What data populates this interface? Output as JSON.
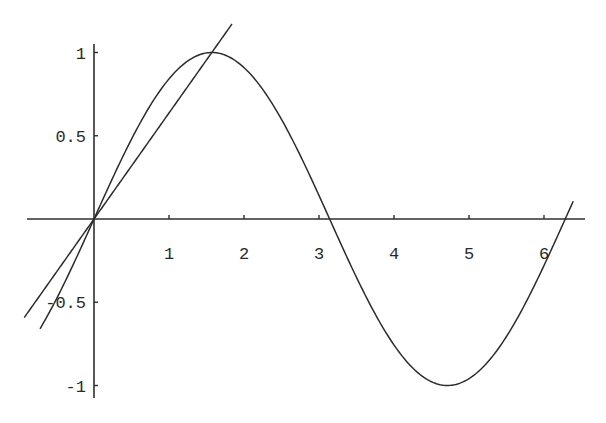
{
  "chart_data": {
    "type": "line",
    "title": "",
    "xlabel": "",
    "ylabel": "",
    "xlim": [
      -0.9,
      6.6
    ],
    "ylim": [
      -1.07,
      1.05
    ],
    "grid": false,
    "legend": null,
    "x_ticks": [
      1,
      2,
      3,
      4,
      5,
      6
    ],
    "x_tick_labels": [
      "1",
      "2",
      "3",
      "4",
      "5",
      "6"
    ],
    "y_ticks": [
      1,
      0.5,
      -0.5,
      -1
    ],
    "y_tick_labels": [
      "1",
      "0.5",
      "-0.5",
      "-1"
    ],
    "series": [
      {
        "name": "sin(x)",
        "function": "sin(x)",
        "x_range": [
          -0.72,
          6.39
        ],
        "x": [
          -0.72,
          0,
          0.5,
          1,
          1.5708,
          2,
          2.5,
          3,
          3.1416,
          3.5,
          4,
          4.7124,
          5,
          5.5,
          6,
          6.2832,
          6.39
        ],
        "values": [
          -0.66,
          0,
          0.479,
          0.841,
          1,
          0.909,
          0.598,
          0.141,
          0,
          -0.351,
          -0.757,
          -1,
          -0.959,
          -0.706,
          -0.279,
          0,
          0.106
        ]
      },
      {
        "name": "line y = (2/pi) x",
        "function": "2*x/pi",
        "x_range": [
          -0.93,
          1.84
        ],
        "x": [
          -0.93,
          0,
          1.5708,
          1.84
        ],
        "values": [
          -0.59,
          0,
          1,
          1.17
        ]
      }
    ],
    "annotations": []
  },
  "axes": {
    "origin_px": [
      94,
      219
    ],
    "px_per_unit_x": 75,
    "px_per_unit_y": 166.5,
    "x_axis_px_range": [
      27,
      585
    ],
    "y_axis_px_range": [
      44,
      398
    ],
    "line_color": "#2c2c2c",
    "background": "#ffffff"
  }
}
